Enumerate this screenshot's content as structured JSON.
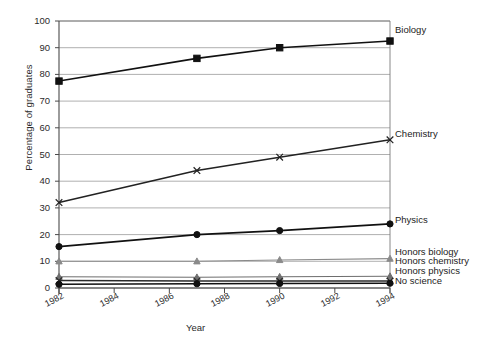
{
  "chart_data": {
    "type": "line",
    "title": "",
    "xlabel": "Year",
    "ylabel": "Percentage of graduates",
    "xlim": [
      1982,
      1994
    ],
    "ylim": [
      0,
      100
    ],
    "grid": true,
    "legend_position": "right-inline-labels",
    "x": [
      1982,
      1987,
      1990,
      1994
    ],
    "xticks": [
      "1982",
      "1984",
      "1986",
      "1988",
      "1990",
      "1992",
      "1994"
    ],
    "yticks": [
      "0",
      "10",
      "20",
      "30",
      "40",
      "50",
      "60",
      "70",
      "80",
      "90",
      "100"
    ],
    "series": [
      {
        "name": "Biology",
        "marker": "filled-square",
        "color": "#111111",
        "label_y_value": 96.5,
        "values": [
          77.5,
          86,
          90,
          92.5
        ]
      },
      {
        "name": "Chemistry",
        "marker": "cross-x",
        "color": "#222222",
        "label_y_value": 57.5,
        "values": [
          32,
          44,
          49,
          55.5
        ]
      },
      {
        "name": "Physics",
        "marker": "filled-circle",
        "color": "#111111",
        "label_y_value": 25.5,
        "values": [
          15.5,
          20,
          21.5,
          24
        ]
      },
      {
        "name": "Honors biology",
        "marker": "filled-triangle",
        "color": "#8a8a8a",
        "label_y_value": 13.5,
        "values": [
          10,
          10,
          10.5,
          11
        ]
      },
      {
        "name": "Honors chemistry",
        "marker": "filled-triangle",
        "color": "#6e6e6e",
        "label_y_value": 10.0,
        "values": [
          4.2,
          4.0,
          4.2,
          4.4
        ]
      },
      {
        "name": "Honors physics",
        "marker": "cross-x",
        "color": "#2a2a2a",
        "label_y_value": 6.3,
        "values": [
          2.8,
          2.6,
          2.6,
          2.6
        ]
      },
      {
        "name": "No science",
        "marker": "filled-circle",
        "color": "#111111",
        "label_y_value": 2.8,
        "values": [
          1.4,
          1.6,
          1.7,
          1.8
        ]
      }
    ],
    "caption": "Fig. 3  Loss of signature and mathematics by the level of graduates"
  }
}
